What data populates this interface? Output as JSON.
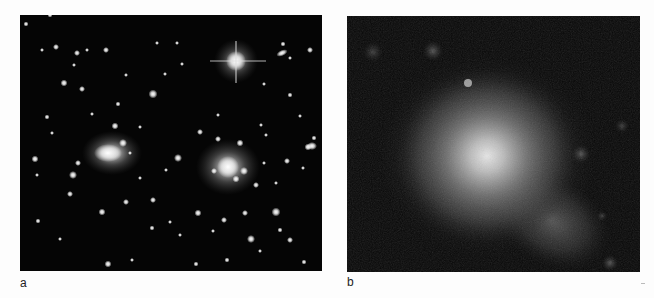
{
  "figure": {
    "panels": [
      {
        "id": "a",
        "label": "a",
        "description": "Optical image of a galaxy cluster field: many point-like stars and galaxies on black sky, one bright diffraction-spike star upper right, two large elliptical galaxies (left-center and right-center)"
      },
      {
        "id": "b",
        "label": "b",
        "description": "X-ray image of the same field: diffuse grey extended emission centered slightly left of middle with a tail extending to the lower right, a few faint compact sources around"
      }
    ],
    "colors": {
      "background": "#fdfdfd",
      "panel_sky": "#050505",
      "label_text": "#222222"
    }
  }
}
